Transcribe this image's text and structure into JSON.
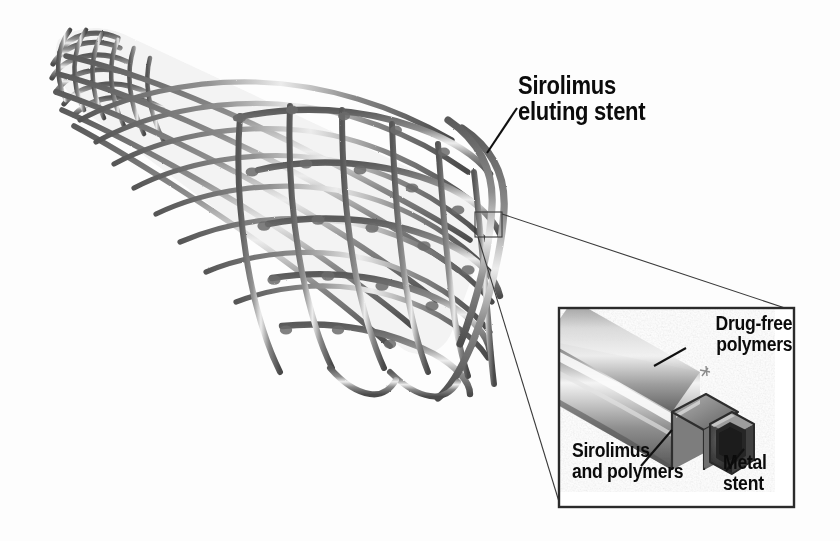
{
  "figure": {
    "background_color": "#fdfdfd",
    "ink_color": "#0b0b0b",
    "style": "grayscale pencil medical illustration"
  },
  "labels": {
    "main": "Sirolimus\neluting stent",
    "drug_free": "Drug-free\npolymers",
    "sirolimus_polymers": "Sirolimus\nand polymers",
    "metal_stent": "Metal\nstent"
  },
  "stent": {
    "description": "Braided wire mesh tapered cylinder narrowing toward upper left",
    "wire_color": "#6f6f6f",
    "wire_highlight": "#e8e8e8",
    "wire_shadow": "#3a3a3a"
  },
  "inset": {
    "description": "Magnified cross-section of a single stent strut",
    "border_color": "#2b2b2b",
    "layers": [
      {
        "name": "Drug-free polymers",
        "role": "outer coating"
      },
      {
        "name": "Sirolimus and polymers",
        "role": "drug reservoir layer"
      },
      {
        "name": "Metal stent",
        "role": "metal core"
      }
    ],
    "tube_light": "#f2f2f2",
    "tube_mid": "#9a9a9a",
    "tube_dark": "#4a4a4a",
    "core_dark": "#2e2e2e"
  },
  "callout": {
    "source_rect": {
      "x": 475,
      "y": 212,
      "width": 27,
      "height": 25
    },
    "target_box": {
      "x": 558,
      "y": 307,
      "width": 237,
      "height": 201
    }
  }
}
